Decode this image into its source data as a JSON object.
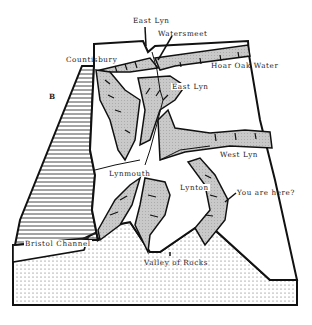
{
  "figure": {
    "panel_letter": "B",
    "labels": {
      "east_lyn_top": "East Lyn",
      "watersmeet": "Watersmeet",
      "countisbury": "Countisbury",
      "hoar_oak_water": "Hoar Oak Water",
      "east_lyn_mid": "East Lyn",
      "west_lyn": "West Lyn",
      "lynmouth": "Lynmouth",
      "lynton": "Lynton",
      "you_are_here": "You are here?",
      "bristol_channel": "Bristol Channel",
      "valley_of_rocks": "Valley of Rocks"
    },
    "colors": {
      "outline": "#111111",
      "valley_fill": "#c8c8c8",
      "sea_hatch": "#333333",
      "stipple": "#555555",
      "background": "#ffffff"
    }
  }
}
